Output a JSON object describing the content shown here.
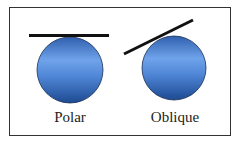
{
  "diagram": {
    "panels": [
      {
        "label": "Polar",
        "line_orientation": "horizontal-tangent-top"
      },
      {
        "label": "Oblique",
        "line_orientation": "tilted-tangent"
      }
    ],
    "colors": {
      "sphere_light": "#6a9ee6",
      "sphere_dark": "#1f4f9a",
      "line": "#111111",
      "border": "#333333"
    }
  }
}
